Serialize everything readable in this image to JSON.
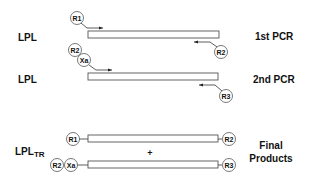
{
  "diagram": {
    "rows": {
      "first_pcr": {
        "left_label": "LPL",
        "right_label": "1st PCR",
        "forward_primer": [
          "R1"
        ],
        "reverse_primer": [
          "R2"
        ]
      },
      "second_pcr": {
        "left_label": "LPL",
        "right_label": "2nd PCR",
        "forward_primer": [
          "R2",
          "Xa"
        ],
        "reverse_primer": [
          "R3"
        ]
      },
      "final": {
        "left_label_main": "LPL",
        "left_label_sub": "TR",
        "right_label_line1": "Final",
        "right_label_line2": "Products",
        "plus": "+",
        "product1": {
          "left": [
            "R1"
          ],
          "right": [
            "R2"
          ]
        },
        "product2": {
          "left": [
            "R2",
            "Xa"
          ],
          "right": [
            "R3"
          ]
        }
      }
    },
    "colors": {
      "stroke": "#555555",
      "text": "#111111",
      "background": "#ffffff"
    }
  }
}
